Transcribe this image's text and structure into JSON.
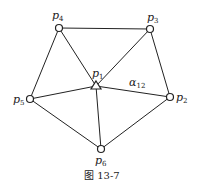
{
  "figure": {
    "caption": "图 13-7",
    "nodes": [
      {
        "id": "p1",
        "label": "p",
        "sub": "1",
        "shape": "triangle",
        "x": 96,
        "y": 85
      },
      {
        "id": "p2",
        "label": "p",
        "sub": "2",
        "shape": "circle",
        "x": 170,
        "y": 97
      },
      {
        "id": "p3",
        "label": "p",
        "sub": "3",
        "shape": "circle",
        "x": 150,
        "y": 29
      },
      {
        "id": "p4",
        "label": "p",
        "sub": "4",
        "shape": "circle",
        "x": 59,
        "y": 28
      },
      {
        "id": "p5",
        "label": "p",
        "sub": "5",
        "shape": "circle",
        "x": 30,
        "y": 99
      },
      {
        "id": "p6",
        "label": "p",
        "sub": "6",
        "shape": "circle",
        "x": 101,
        "y": 149
      }
    ],
    "edges": [
      [
        "p4",
        "p3"
      ],
      [
        "p3",
        "p2"
      ],
      [
        "p2",
        "p6"
      ],
      [
        "p6",
        "p5"
      ],
      [
        "p5",
        "p4"
      ],
      [
        "p1",
        "p2"
      ],
      [
        "p1",
        "p3"
      ],
      [
        "p1",
        "p4"
      ],
      [
        "p1",
        "p5"
      ],
      [
        "p1",
        "p6"
      ]
    ],
    "angle_label": {
      "symbol": "α",
      "sub": "12"
    }
  }
}
